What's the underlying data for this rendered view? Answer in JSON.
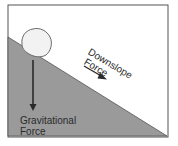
{
  "diagram": {
    "type": "slope-force-illustration",
    "labels": {
      "downslope_line1": "Downslope",
      "downslope_line2": "Force",
      "gravitational_line1": "Gravitational",
      "gravitational_line2": "Force"
    },
    "colors": {
      "slope_fill": "#9a9a9a",
      "frame_stroke": "#555555",
      "arrow": "#2a2a2a",
      "boulder_fill": "#f2f2f2",
      "boulder_stroke": "#6a6a6a",
      "background": "#ffffff"
    },
    "elements": {
      "boulder": "rock resting on slope",
      "gravity_arrow": "vertical arrow pointing down",
      "downslope_arrow": "arrow pointing down the slope"
    }
  }
}
